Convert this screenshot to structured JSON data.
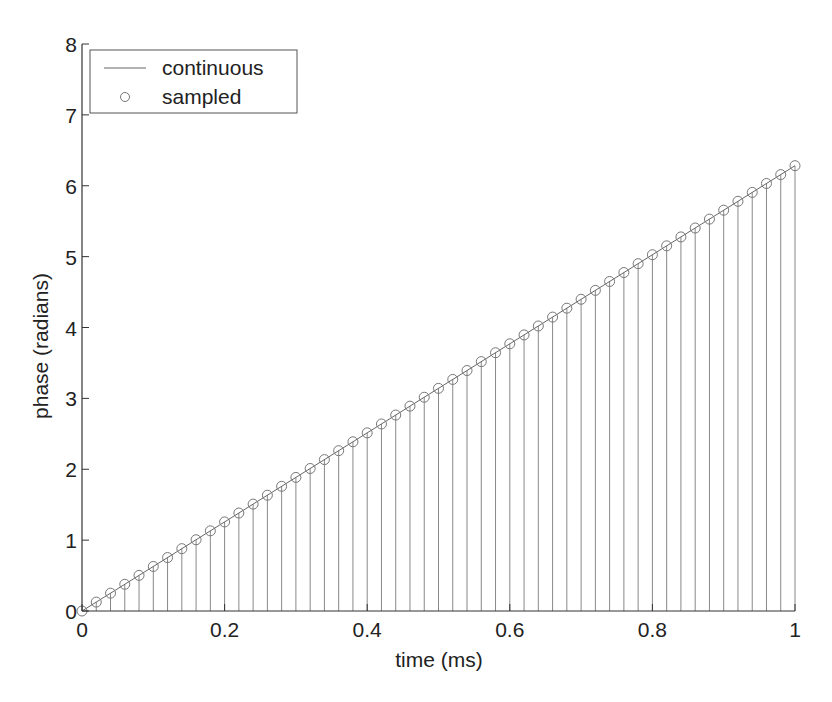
{
  "chart_data": {
    "type": "line",
    "title": "",
    "xlabel": "time (ms)",
    "ylabel": "phase (radians)",
    "xlim": [
      0,
      1
    ],
    "ylim": [
      0,
      8
    ],
    "xticks": [
      "0",
      "0.2",
      "0.4",
      "0.6",
      "0.8",
      "1"
    ],
    "yticks": [
      "0",
      "1",
      "2",
      "3",
      "4",
      "5",
      "6",
      "7",
      "8"
    ],
    "grid": false,
    "legend_position": "upper left",
    "series": [
      {
        "name": "continuous",
        "style": "line",
        "x": [
          0,
          1
        ],
        "y": [
          0,
          6.2832
        ]
      },
      {
        "name": "sampled",
        "style": "stem-circle",
        "x_start": 0,
        "x_step": 0.02,
        "count": 51,
        "y_formula": "2*pi*x",
        "y_end": 6.2832
      }
    ]
  },
  "legend": {
    "items": [
      {
        "label": "continuous"
      },
      {
        "label": "sampled"
      }
    ]
  },
  "colors": {
    "line": "#666666",
    "axis": "#333333",
    "text": "#222222"
  }
}
